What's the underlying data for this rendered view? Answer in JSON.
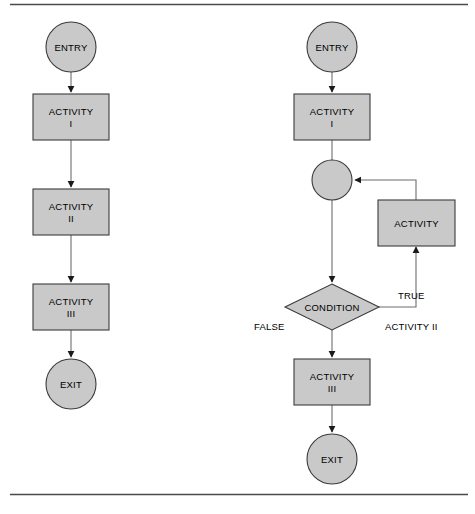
{
  "figure": {
    "colors": {
      "shape_fill": "#c9c9c9",
      "shape_stroke": "#3b3b3b",
      "connector": "#6d6d6d",
      "arrow_head": "#1a1a1a",
      "rule": "#4a4a4a",
      "background": "#ffffff",
      "text": "#000000"
    }
  },
  "rules": {
    "top_rule": "horizontal-rule-top",
    "bottom_rule": "horizontal-rule-bottom"
  },
  "diagram_left": {
    "name": "sequential-flow",
    "nodes": [
      {
        "id": "entry",
        "type": "terminator",
        "label": "ENTRY"
      },
      {
        "id": "activity1",
        "type": "process",
        "label_line1": "ACTIVITY",
        "label_line2": "I"
      },
      {
        "id": "activity2",
        "type": "process",
        "label_line1": "ACTIVITY",
        "label_line2": "II"
      },
      {
        "id": "activity3",
        "type": "process",
        "label_line1": "ACTIVITY",
        "label_line2": "III"
      },
      {
        "id": "exit",
        "type": "terminator",
        "label": "EXIT"
      }
    ]
  },
  "diagram_right": {
    "name": "conditional-loop-flow",
    "nodes": [
      {
        "id": "entry",
        "type": "terminator",
        "label": "ENTRY"
      },
      {
        "id": "activity1",
        "type": "process",
        "label_line1": "ACTIVITY",
        "label_line2": "I"
      },
      {
        "id": "merge",
        "type": "merge-junction",
        "label": ""
      },
      {
        "id": "loop_activity",
        "type": "process",
        "label_line1": "ACTIVITY",
        "label_line2": ""
      },
      {
        "id": "condition",
        "type": "decision",
        "label": "CONDITION"
      },
      {
        "id": "activity3",
        "type": "process",
        "label_line1": "ACTIVITY",
        "label_line2": "III"
      },
      {
        "id": "exit",
        "type": "terminator",
        "label": "EXIT"
      }
    ],
    "edge_labels": {
      "true_branch": "TRUE",
      "false_branch": "FALSE",
      "loop_caption": "ACTIVITY II"
    }
  }
}
